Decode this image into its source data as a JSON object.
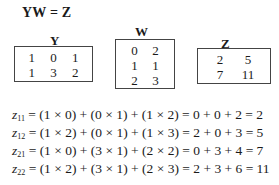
{
  "title": "YW = Z",
  "matrices": {
    "Y": {
      "label": "Y",
      "rows": [
        [
          "1",
          "0",
          "1"
        ],
        [
          "1",
          "3",
          "2"
        ]
      ]
    },
    "W": {
      "label": "W",
      "rows": [
        [
          "0",
          "2"
        ],
        [
          "1",
          "1"
        ],
        [
          "2",
          "3"
        ]
      ]
    },
    "Z": {
      "label": "Z",
      "rows": [
        [
          "2",
          "5"
        ],
        [
          "7",
          "11"
        ]
      ]
    }
  },
  "equations": [
    {
      "var": "z",
      "sub": "11",
      "expr": " = (1 × 0) + (0 × 1) + (1 × 2) = 0 + 0 + 2 = 2"
    },
    {
      "var": "z",
      "sub": "12",
      "expr": " = (1 × 2) + (0 × 1) + (1 × 3) = 2 + 0 + 3 = 5"
    },
    {
      "var": "z",
      "sub": "21",
      "expr": " = (1 × 0) + (3 × 1) + (2 × 2) = 0 + 3 + 4 = 7"
    },
    {
      "var": "z",
      "sub": "22",
      "expr": " = (1 × 2) + (3 × 1) + (2 × 3) = 2 + 3 + 6 = 11"
    }
  ]
}
